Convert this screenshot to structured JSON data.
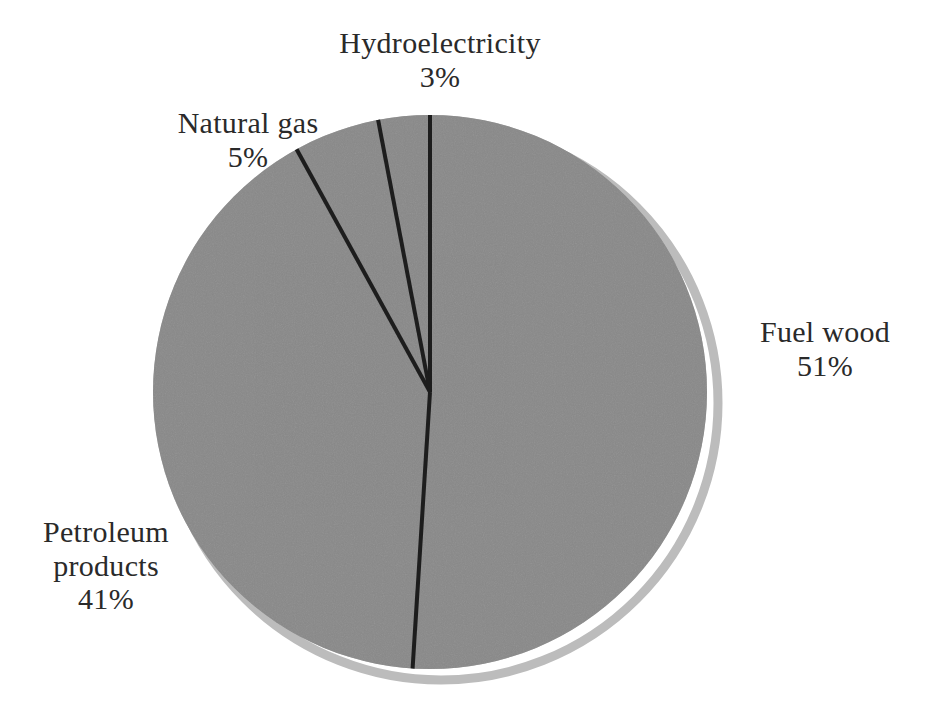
{
  "chart_data": {
    "type": "pie",
    "title": "",
    "subtitle": "",
    "xlabel": "",
    "ylabel": "",
    "grid": false,
    "legend": "none",
    "label_format": "name + percent",
    "start_angle_deg": 0,
    "direction": "clockwise",
    "units": "percent",
    "categories": [
      "Fuel wood",
      "Petroleum products",
      "Natural gas",
      "Hydroelectricity"
    ],
    "values": [
      51,
      41,
      5,
      3
    ],
    "slices": [
      {
        "name": "Fuel wood",
        "value": 51,
        "percent_label": "51%",
        "start_deg": 0,
        "end_deg": 183.6,
        "fill": "#878787",
        "outline": "#1a1a1a"
      },
      {
        "name": "Petroleum products",
        "value": 41,
        "percent_label": "41%",
        "start_deg": 183.6,
        "end_deg": 331.2,
        "fill": "#878787",
        "outline": "#1a1a1a"
      },
      {
        "name": "Natural gas",
        "value": 5,
        "percent_label": "5%",
        "start_deg": 331.2,
        "end_deg": 349.2,
        "fill": "#878787",
        "outline": "#1a1a1a"
      },
      {
        "name": "Hydroelectricity",
        "value": 3,
        "percent_label": "3%",
        "start_deg": 349.2,
        "end_deg": 360,
        "fill": "#878787",
        "outline": "#1a1a1a"
      }
    ]
  },
  "labels": {
    "hydroelectricity": {
      "name": "Hydroelectricity",
      "percent": "3%"
    },
    "natural_gas": {
      "name": "Natural gas",
      "percent": "5%"
    },
    "fuel_wood": {
      "name": "Fuel wood",
      "percent": "51%"
    },
    "petroleum_products": {
      "name": "Petroleum",
      "name2": "products",
      "percent": "41%"
    }
  },
  "style": {
    "background": "#ffffff",
    "slice_fill": "#878787",
    "slice_outline": "#1a1a1a",
    "shadow_color": "#b9b9b9",
    "text_color": "#2a2a2a"
  }
}
